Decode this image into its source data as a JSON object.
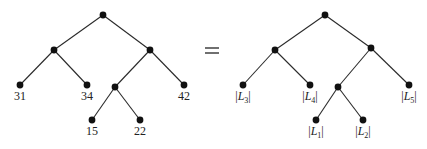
{
  "diagram": {
    "type": "binary-tree-equality",
    "relation_symbol": "=",
    "left_tree": {
      "name": "numeric-tree",
      "nodes": [
        {
          "id": "r",
          "x": 103,
          "y": 15
        },
        {
          "id": "a",
          "x": 54,
          "y": 50
        },
        {
          "id": "b",
          "x": 150,
          "y": 50
        },
        {
          "id": "l31",
          "x": 20,
          "y": 85,
          "label": "31"
        },
        {
          "id": "l34",
          "x": 87,
          "y": 85,
          "label": "34"
        },
        {
          "id": "c",
          "x": 115,
          "y": 87
        },
        {
          "id": "l42",
          "x": 184,
          "y": 85,
          "label": "42"
        },
        {
          "id": "l15",
          "x": 92,
          "y": 120,
          "label": "15"
        },
        {
          "id": "l22",
          "x": 140,
          "y": 120,
          "label": "22"
        }
      ],
      "edges": [
        [
          "r",
          "a"
        ],
        [
          "r",
          "b"
        ],
        [
          "a",
          "l31"
        ],
        [
          "a",
          "l34"
        ],
        [
          "b",
          "c"
        ],
        [
          "b",
          "l42"
        ],
        [
          "c",
          "l15"
        ],
        [
          "c",
          "l22"
        ]
      ]
    },
    "right_tree": {
      "name": "set-size-tree",
      "nodes": [
        {
          "id": "r",
          "x": 325,
          "y": 15
        },
        {
          "id": "a",
          "x": 275,
          "y": 50
        },
        {
          "id": "b",
          "x": 371,
          "y": 48
        },
        {
          "id": "L3",
          "x": 243,
          "y": 85,
          "label": "|L3|",
          "base": "L",
          "sub": "3"
        },
        {
          "id": "L4",
          "x": 310,
          "y": 85,
          "label": "|L4|",
          "base": "L",
          "sub": "4"
        },
        {
          "id": "c",
          "x": 338,
          "y": 87
        },
        {
          "id": "L5",
          "x": 409,
          "y": 85,
          "label": "|L5|",
          "base": "L",
          "sub": "5"
        },
        {
          "id": "L1",
          "x": 316,
          "y": 120,
          "label": "|L1|",
          "base": "L",
          "sub": "1"
        },
        {
          "id": "L2",
          "x": 363,
          "y": 120,
          "label": "|L2|",
          "base": "L",
          "sub": "2"
        }
      ],
      "edges": [
        [
          "r",
          "a"
        ],
        [
          "r",
          "b"
        ],
        [
          "a",
          "L3"
        ],
        [
          "a",
          "L4"
        ],
        [
          "b",
          "c"
        ],
        [
          "b",
          "L5"
        ],
        [
          "c",
          "L1"
        ],
        [
          "c",
          "L2"
        ]
      ]
    },
    "leaf_labels_left": [
      "31",
      "34",
      "42",
      "15",
      "22"
    ],
    "leaf_labels_right": [
      "|L3|",
      "|L4|",
      "|L5|",
      "|L1|",
      "|L2|"
    ]
  }
}
